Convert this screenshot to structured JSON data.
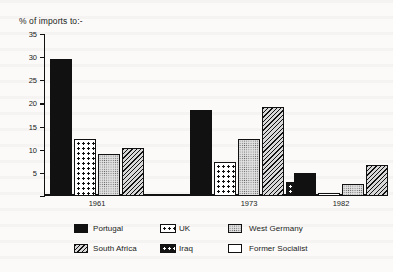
{
  "chart_data": {
    "type": "bar",
    "title": "% of imports to:-",
    "xlabel": "",
    "ylabel": "",
    "ylim": [
      0,
      35
    ],
    "yticks": [
      0,
      5,
      10,
      15,
      20,
      25,
      30,
      35
    ],
    "ytick_labels": [
      "",
      "5",
      "10",
      "15",
      "20",
      "25",
      "30",
      "35"
    ],
    "grid": false,
    "legend_position": "bottom",
    "categories": [
      "1961",
      "1973",
      "1982"
    ],
    "series": [
      {
        "name": "Portugal",
        "pattern": "solid",
        "values": [
          29.7,
          18.6,
          4.9
        ]
      },
      {
        "name": "UK",
        "pattern": "dot-black",
        "values": [
          12.3,
          7.4,
          0.6
        ]
      },
      {
        "name": "West Germany",
        "pattern": "fine-dots",
        "values": [
          9.1,
          12.4,
          2.7
        ]
      },
      {
        "name": "South Africa",
        "pattern": "hatch",
        "values": [
          10.4,
          19.3,
          6.8
        ]
      },
      {
        "name": "Iraq",
        "pattern": "dot-white",
        "values": [
          null,
          3.1,
          null
        ]
      },
      {
        "name": "Former Socialist",
        "pattern": "white",
        "values": [
          null,
          null,
          12.8
        ]
      }
    ]
  },
  "legend": {
    "items": [
      {
        "label": "Portugal",
        "pattern": "solid"
      },
      {
        "label": "UK",
        "pattern": "dot-black"
      },
      {
        "label": "West Germany",
        "pattern": "fine-dots"
      },
      {
        "label": "South Africa",
        "pattern": "hatch"
      },
      {
        "label": "Iraq",
        "pattern": "dot-white"
      },
      {
        "label": "Former Socialist",
        "pattern": "white"
      }
    ]
  },
  "colors": {
    "ink": "#111111",
    "paper": "#fbfaf8",
    "light_fill": "#e2e2e2"
  }
}
